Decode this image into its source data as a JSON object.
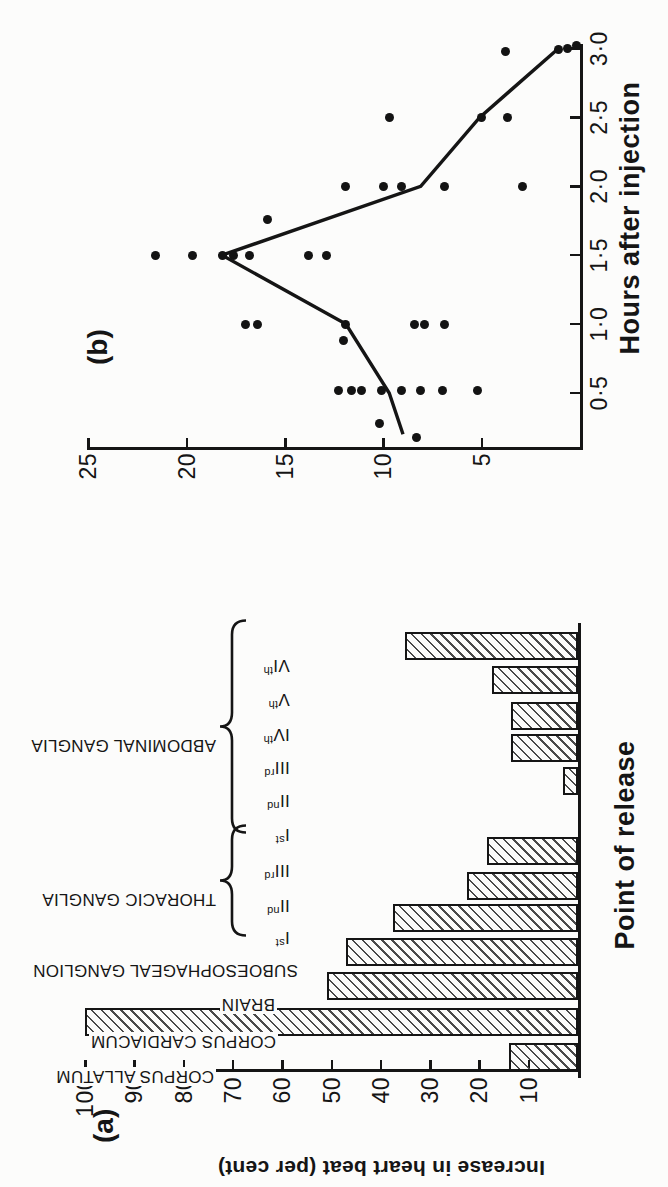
{
  "figure_caption": {
    "panel_a_label": "(a)",
    "panel_b_label": "(b)"
  },
  "colors": {
    "ink": "#151515",
    "paper": "#fcfcfb",
    "hatch_line": "#4a4a4a"
  },
  "chart_data": [
    {
      "id": "a",
      "type": "bar",
      "orientation_on_page": "rotated 90deg counterclockwise",
      "xlabel": "Point of release",
      "ylabel": "Increase in heart beat (per cent)",
      "ylim": [
        0,
        100
      ],
      "yticks": [
        10,
        20,
        30,
        40,
        50,
        60,
        70,
        80,
        90,
        100
      ],
      "bar_style": "diagonal-hatch",
      "categories": [
        "CORPUS ALLATUM",
        "CORPUS CARDIACUM",
        "BRAIN",
        "SUBOESOPHAGEAL GANGLION",
        "Ist",
        "IInd",
        "IIIrd",
        "Ist",
        "IInd",
        "IIIrd",
        "IVth",
        "Vth",
        "VIth"
      ],
      "values": [
        14,
        100,
        51,
        47,
        37.5,
        22.5,
        18.5,
        0,
        3,
        13.5,
        13.5,
        17.5,
        35
      ],
      "groups": [
        {
          "name": "THORACIC GANGLIA",
          "from": 4,
          "to": 6
        },
        {
          "name": "ABDOMINAL GANGLIA",
          "from": 7,
          "to": 12
        }
      ]
    },
    {
      "id": "b",
      "type": "scatter+line",
      "orientation_on_page": "rotated 90deg counterclockwise",
      "xlabel": "Hours after injection",
      "xticks": [
        0.5,
        1.0,
        1.5,
        2.0,
        2.5,
        3.0
      ],
      "xtick_labels": [
        "0·5",
        "1·0",
        "1·5",
        "2·0",
        "2·5",
        "3·0"
      ],
      "ylim": [
        0,
        25
      ],
      "yticks": [
        5,
        10,
        15,
        20,
        25
      ],
      "points": [
        [
          0.18,
          8.3
        ],
        [
          0.28,
          10.2
        ],
        [
          0.52,
          12.3
        ],
        [
          0.52,
          11.6
        ],
        [
          0.52,
          11.1
        ],
        [
          0.52,
          10.1
        ],
        [
          0.52,
          9.1
        ],
        [
          0.52,
          8.1
        ],
        [
          0.52,
          7.0
        ],
        [
          0.52,
          5.2
        ],
        [
          0.88,
          12.0
        ],
        [
          1.0,
          17.0
        ],
        [
          1.0,
          16.4
        ],
        [
          1.0,
          11.9
        ],
        [
          1.0,
          8.4
        ],
        [
          1.0,
          7.9
        ],
        [
          1.0,
          6.9
        ],
        [
          1.5,
          21.6
        ],
        [
          1.5,
          19.7
        ],
        [
          1.5,
          18.2
        ],
        [
          1.5,
          17.6
        ],
        [
          1.5,
          16.8
        ],
        [
          1.5,
          13.8
        ],
        [
          1.5,
          12.9
        ],
        [
          1.76,
          15.9
        ],
        [
          2.0,
          11.9
        ],
        [
          2.0,
          10.0
        ],
        [
          2.0,
          9.1
        ],
        [
          2.0,
          6.9
        ],
        [
          2.0,
          2.9
        ],
        [
          2.5,
          9.7
        ],
        [
          2.5,
          5.0
        ],
        [
          2.5,
          3.7
        ],
        [
          2.98,
          3.8
        ],
        [
          2.99,
          1.1
        ],
        [
          3.0,
          0.65
        ],
        [
          3.02,
          0.2
        ]
      ],
      "mean_line": [
        [
          0.2,
          9.0
        ],
        [
          0.5,
          9.7
        ],
        [
          1.0,
          11.9
        ],
        [
          1.5,
          18.2
        ],
        [
          2.0,
          8.1
        ],
        [
          2.5,
          5.1
        ],
        [
          3.0,
          1.1
        ]
      ]
    }
  ]
}
